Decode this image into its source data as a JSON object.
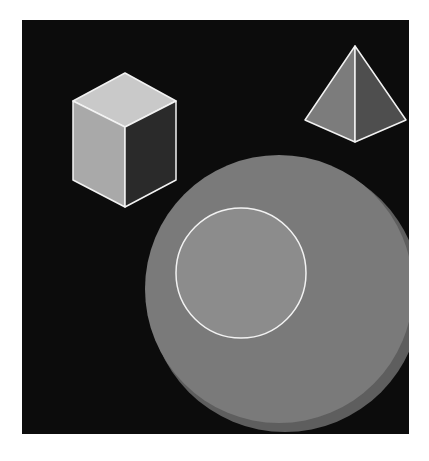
{
  "scene": {
    "background_color": "#0c0c0c",
    "page_color": "#ffffff",
    "outline_color": "#f2f2f2",
    "shapes": {
      "cube": {
        "label": "cube",
        "top_face_color": "#c9c9c9",
        "left_face_color": "#a9a9a9",
        "right_face_color": "#2a2a2a"
      },
      "pyramid": {
        "label": "pyramid",
        "left_face_color": "#7c7c7c",
        "right_face_color": "#4e4e4e"
      },
      "cylinder": {
        "label": "cylinder",
        "side_color": "#5e5e5e",
        "top_color": "#7a7a7a"
      },
      "inner_circle": {
        "label": "circle",
        "fill_color": "#8c8c8c"
      }
    }
  }
}
